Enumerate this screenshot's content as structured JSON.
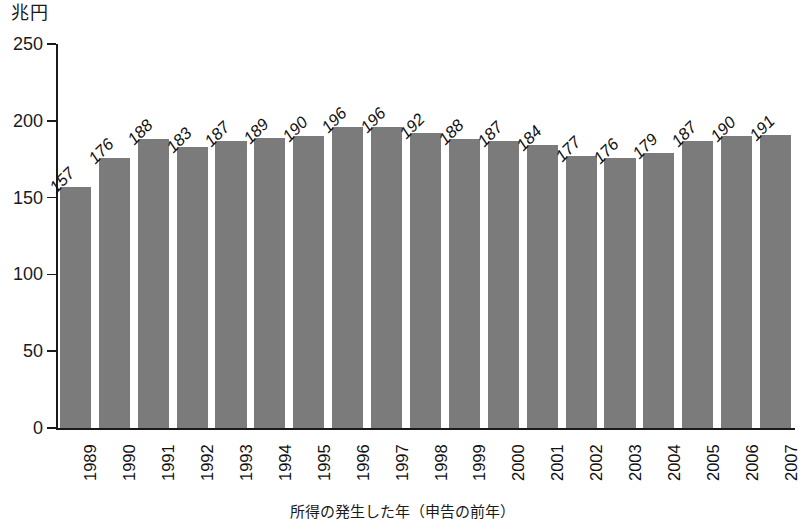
{
  "chart_data": {
    "type": "bar",
    "title": "",
    "unit_label": "兆円",
    "xlabel": "所得の発生した年（申告の前年）",
    "ylabel": "",
    "ylim": [
      0,
      250
    ],
    "ytick_values": [
      250,
      200,
      150,
      100,
      50,
      0
    ],
    "ytick_labels": [
      "250",
      "200",
      "150",
      "100",
      "50",
      "0"
    ],
    "grid": false,
    "legend": null,
    "categories": [
      "1989",
      "1990",
      "1991",
      "1992",
      "1993",
      "1994",
      "1995",
      "1996",
      "1997",
      "1998",
      "1999",
      "2000",
      "2001",
      "2002",
      "2003",
      "2004",
      "2005",
      "2006",
      "2007"
    ],
    "values": [
      157,
      176,
      188,
      183,
      187,
      189,
      190,
      196,
      196,
      192,
      188,
      187,
      184,
      177,
      176,
      179,
      187,
      190,
      191
    ],
    "value_labels": [
      "157",
      "176",
      "188",
      "183",
      "187",
      "189",
      "190",
      "196",
      "196",
      "192",
      "188",
      "187",
      "184",
      "177",
      "176",
      "179",
      "187",
      "190",
      "191"
    ],
    "bar_color": "#7b7b7b",
    "axis_color": "#1a1a1a",
    "background_color": "#ffffff"
  }
}
